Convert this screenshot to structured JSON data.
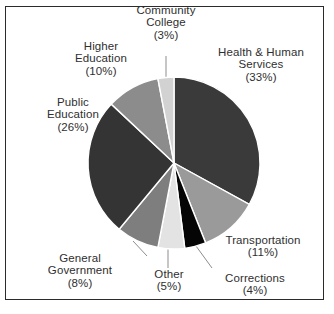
{
  "chart_data": {
    "type": "pie",
    "title": "",
    "legend_position": "outside-labels",
    "grid": false,
    "value_unit": "percent",
    "categories": [
      "Health & Human Services",
      "Transportation",
      "Corrections",
      "Other",
      "General Government",
      "Public Education",
      "Higher Education",
      "Community College"
    ],
    "values": [
      33,
      11,
      4,
      5,
      8,
      26,
      10,
      3
    ],
    "colors": [
      "#3a3a3a",
      "#9a9a9a",
      "#050505",
      "#e3e3e3",
      "#7e7e7e",
      "#343434",
      "#8c8c8c",
      "#d2d2d2"
    ],
    "slices": [
      {
        "name": "Health & Human Services",
        "value": 33,
        "label": "Health & Human Services",
        "percent_label": "(33%)",
        "color": "#3a3a3a",
        "start_angle": 0,
        "end_angle": 118.8
      },
      {
        "name": "Transportation",
        "value": 11,
        "label": "Transportation",
        "percent_label": "(11%)",
        "color": "#9a9a9a",
        "start_angle": 118.8,
        "end_angle": 158.4
      },
      {
        "name": "Corrections",
        "value": 4,
        "label": "Corrections",
        "percent_label": "(4%)",
        "color": "#050505",
        "start_angle": 158.4,
        "end_angle": 172.8
      },
      {
        "name": "Other",
        "value": 5,
        "label": "Other",
        "percent_label": "(5%)",
        "color": "#e3e3e3",
        "start_angle": 172.8,
        "end_angle": 190.8
      },
      {
        "name": "General Government",
        "value": 8,
        "label": "General Government",
        "percent_label": "(8%)",
        "color": "#7e7e7e",
        "start_angle": 190.8,
        "end_angle": 219.6
      },
      {
        "name": "Public Education",
        "value": 26,
        "label": "Public Education",
        "percent_label": "(26%)",
        "color": "#343434",
        "start_angle": 219.6,
        "end_angle": 313.2
      },
      {
        "name": "Higher Education",
        "value": 10,
        "label": "Higher Education",
        "percent_label": "(10%)",
        "color": "#8c8c8c",
        "start_angle": 313.2,
        "end_angle": 349.2
      },
      {
        "name": "Community College",
        "value": 3,
        "label": "Community College",
        "percent_label": "(3%)",
        "color": "#d2d2d2",
        "start_angle": 349.2,
        "end_angle": 360
      }
    ]
  },
  "labels": {
    "community_college": {
      "line1": "Community",
      "line2": "College",
      "line3": "(3%)"
    },
    "health_human_services": {
      "line1": "Health & Human",
      "line2": "Services",
      "line3": "(33%)"
    },
    "higher_education": {
      "line1": "Higher",
      "line2": "Education",
      "line3": "(10%)"
    },
    "public_education": {
      "line1": "Public",
      "line2": "Education",
      "line3": "(26%)"
    },
    "general_government": {
      "line1": "General",
      "line2": "Government",
      "line3": "(8%)"
    },
    "other": {
      "line1": "Other",
      "line2": "(5%)"
    },
    "corrections": {
      "line1": "Corrections",
      "line2": "(4%)"
    },
    "transportation": {
      "line1": "Transportation",
      "line2": "(11%)"
    }
  },
  "style": {
    "frame_color": "#2b2b2b",
    "background": "#ffffff",
    "text_color": "#2f2f2f",
    "leader_color": "#8d8d8d"
  }
}
